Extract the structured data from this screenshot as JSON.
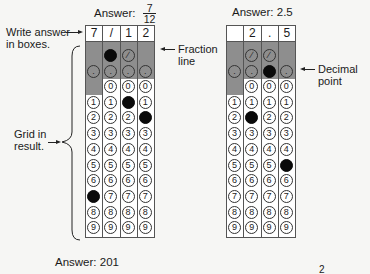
{
  "left_example": {
    "title_prefix": "Answer:",
    "fraction": {
      "numerator": "7",
      "denominator": "12"
    },
    "boxes": [
      "7",
      "/",
      "1",
      "2"
    ],
    "slash_row": [
      null,
      "filled",
      "empty",
      null
    ],
    "dot_row": [
      "empty",
      "empty",
      "empty",
      "empty"
    ],
    "digit_fills": [
      7,
      null,
      1,
      2
    ],
    "annotations": {
      "write_answer": "Write answer\nin boxes.",
      "write_answer_line1": "Write answer",
      "write_answer_line2": "in boxes.",
      "fraction_line_1": "Fraction",
      "fraction_line_2": "line",
      "grid_in_1": "Grid in",
      "grid_in_2": "result."
    }
  },
  "right_example": {
    "title": "Answer: 2.5",
    "boxes": [
      "",
      "2",
      ".",
      "5"
    ],
    "slash_row": [
      null,
      "empty",
      "empty",
      null
    ],
    "dot_row": [
      "empty",
      "empty",
      "filled",
      "empty"
    ],
    "digit_fills": [
      null,
      2,
      null,
      5
    ],
    "annotations": {
      "decimal_point_1": "Decimal",
      "decimal_point_2": "point"
    }
  },
  "bottom": {
    "next_answer_title": "Answer: 201",
    "partial_glyph": "2"
  },
  "grid": {
    "digits": [
      "0",
      "1",
      "2",
      "3",
      "4",
      "5",
      "6",
      "7",
      "8",
      "9"
    ],
    "slash_symbol": "∕",
    "dot_symbol": "."
  },
  "colors": {
    "shade": "#8e8e8e",
    "fill": "#0a0a0a",
    "background": "#f6f6f4"
  }
}
